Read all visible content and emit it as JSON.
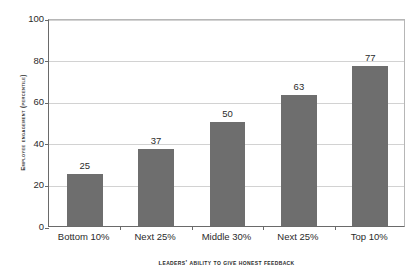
{
  "chart_data": {
    "type": "bar",
    "title": "",
    "categories": [
      "Bottom 10%",
      "Next 25%",
      "Middle 30%",
      "Next 25%",
      "Top 10%"
    ],
    "values": [
      25,
      37,
      50,
      63,
      77
    ],
    "data_labels": [
      "25",
      "37",
      "50",
      "63",
      "77"
    ],
    "xlabel": "Leaders' ability to give honest feedback",
    "ylabel": "Employee engagement (percentile)",
    "ylim": [
      0,
      100
    ],
    "ytick_labels": [
      "0",
      "20",
      "40",
      "60",
      "80",
      "100"
    ],
    "ytick_values": [
      0,
      20,
      40,
      60,
      80,
      100
    ],
    "grid": true,
    "legend": false,
    "bar_color": "#6e6e6e",
    "gridline_color": "#d2d2d2",
    "axis_color": "#6a6a6a",
    "text_color": "#2b2b2b",
    "background": "#ffffff"
  }
}
